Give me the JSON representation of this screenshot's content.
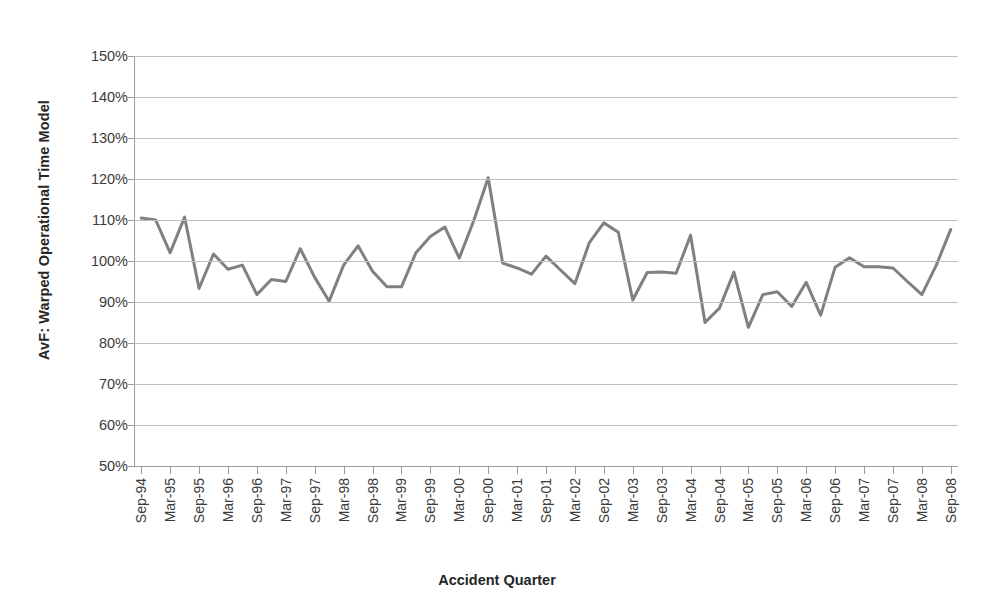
{
  "chart_data": {
    "type": "line",
    "title": "",
    "xlabel": "Accident Quarter",
    "ylabel": "AvF: Warped Operational Time Model",
    "ylim": [
      50,
      150
    ],
    "ytick_labels": [
      "150%",
      "140%",
      "130%",
      "120%",
      "110%",
      "100%",
      "90%",
      "80%",
      "70%",
      "60%",
      "50%"
    ],
    "ytick_values": [
      150,
      140,
      130,
      120,
      110,
      100,
      90,
      80,
      70,
      60,
      50
    ],
    "ytick_suffix": "%",
    "grid": true,
    "legend": false,
    "line_color": "#808080",
    "line_width": 3,
    "marker": "none",
    "x_tick_labels": [
      "Sep-94",
      "Mar-95",
      "Sep-95",
      "Mar-96",
      "Sep-96",
      "Mar-97",
      "Sep-97",
      "Mar-98",
      "Sep-98",
      "Mar-99",
      "Sep-99",
      "Mar-00",
      "Sep-00",
      "Mar-01",
      "Sep-01",
      "Mar-02",
      "Sep-02",
      "Mar-03",
      "Sep-03",
      "Mar-04",
      "Sep-04",
      "Mar-05",
      "Sep-05",
      "Mar-06",
      "Sep-06",
      "Mar-07",
      "Sep-07",
      "Mar-08",
      "Sep-08"
    ],
    "x_tick_interval_quarters": 2,
    "x": [
      "Sep-94",
      "Dec-94",
      "Mar-95",
      "Jun-95",
      "Sep-95",
      "Dec-95",
      "Mar-96",
      "Jun-96",
      "Sep-96",
      "Dec-96",
      "Mar-97",
      "Jun-97",
      "Sep-97",
      "Dec-97",
      "Mar-98",
      "Jun-98",
      "Sep-98",
      "Dec-98",
      "Mar-99",
      "Jun-99",
      "Sep-99",
      "Dec-99",
      "Mar-00",
      "Jun-00",
      "Sep-00",
      "Dec-00",
      "Mar-01",
      "Jun-01",
      "Sep-01",
      "Dec-01",
      "Mar-02",
      "Jun-02",
      "Sep-02",
      "Dec-02",
      "Mar-03",
      "Jun-03",
      "Sep-03",
      "Dec-03",
      "Mar-04",
      "Jun-04",
      "Sep-04",
      "Dec-04",
      "Mar-05",
      "Jun-05",
      "Sep-05",
      "Dec-05",
      "Mar-06",
      "Jun-06",
      "Sep-06",
      "Dec-06",
      "Mar-07",
      "Jun-07",
      "Sep-07",
      "Dec-07",
      "Mar-08",
      "Jun-08",
      "Sep-08"
    ],
    "values": [
      110.5,
      110.0,
      102.0,
      110.7,
      93.3,
      101.7,
      98.0,
      99.0,
      91.8,
      95.5,
      95.0,
      103.0,
      96.0,
      90.2,
      99.0,
      103.7,
      97.5,
      93.7,
      93.7,
      102.0,
      106.0,
      108.3,
      100.7,
      109.8,
      120.3,
      99.5,
      98.3,
      96.8,
      101.2,
      97.8,
      94.5,
      104.5,
      109.3,
      107.0,
      90.5,
      97.2,
      97.3,
      97.0,
      106.3,
      85.0,
      88.5,
      97.3,
      83.8,
      91.8,
      92.5,
      88.9,
      94.8,
      86.8,
      98.5,
      100.8,
      98.6,
      98.6,
      98.3,
      95.0,
      91.8,
      99.0,
      107.7
    ]
  }
}
